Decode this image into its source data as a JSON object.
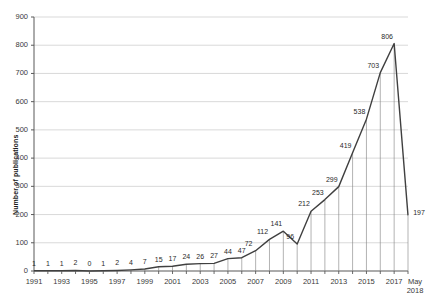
{
  "chart_data": {
    "type": "line",
    "title": "",
    "xlabel": "",
    "ylabel": "Number of publications",
    "ylim": [
      0,
      900
    ],
    "ytick_values": [
      0,
      100,
      200,
      300,
      400,
      500,
      600,
      700,
      800,
      900
    ],
    "ytick_labels": [
      "0",
      "100",
      "200",
      "300",
      "400",
      "500",
      "600",
      "700",
      "800",
      "900"
    ],
    "grid": true,
    "legend": "none",
    "categories": [
      "1991",
      "1992",
      "1993",
      "1994",
      "1995",
      "1996",
      "1997",
      "1998",
      "1999",
      "2000",
      "2001",
      "2002",
      "2003",
      "2004",
      "2005",
      "2006",
      "2007",
      "2008",
      "2009",
      "2010",
      "2011",
      "2012",
      "2013",
      "2014",
      "2015",
      "2016",
      "2017",
      "May 2018"
    ],
    "xtick_labels": [
      "1991",
      "",
      "1993",
      "",
      "1995",
      "",
      "1997",
      "",
      "1999",
      "",
      "2001",
      "",
      "2003",
      "",
      "2005",
      "",
      "2007",
      "",
      "2009",
      "",
      "2011",
      "",
      "2013",
      "",
      "2015",
      "",
      "2017",
      "May 2018"
    ],
    "values": [
      1,
      1,
      1,
      2,
      0,
      1,
      2,
      4,
      7,
      15,
      17,
      24,
      26,
      27,
      44,
      47,
      72,
      112,
      141,
      96,
      212,
      253,
      299,
      419,
      538,
      703,
      806,
      197
    ],
    "point_labels": [
      "1",
      "1",
      "1",
      "2",
      "0",
      "1",
      "2",
      "4",
      "7",
      "15",
      "17",
      "24",
      "26",
      "27",
      "44",
      "47",
      "72",
      "112",
      "141",
      "96",
      "212",
      "253",
      "299",
      "419",
      "538",
      "703",
      "806",
      "197"
    ],
    "line_color": "#404040",
    "drop_line_color": "#808080",
    "grid_color": "#c8c8c8",
    "axis_color": "#595959",
    "last_tick_line1": "May",
    "last_tick_line2": "2018"
  }
}
